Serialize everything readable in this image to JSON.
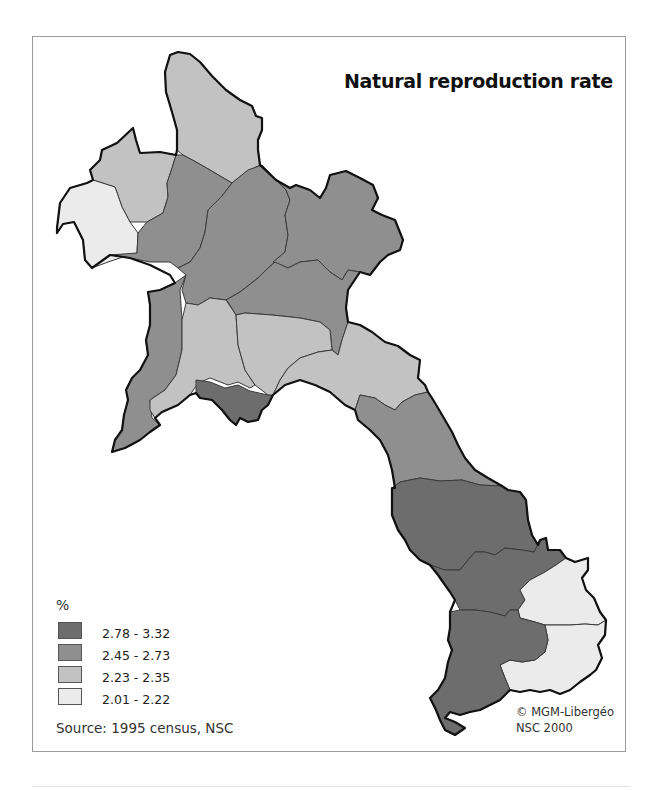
{
  "map": {
    "title": "Natural reproduction rate",
    "country": "Laos",
    "legend": {
      "unit": "%",
      "classes": [
        {
          "label": "2.78 - 3.32",
          "color": "#6d6d6d"
        },
        {
          "label": "2.45 - 2.73",
          "color": "#8f8f8f"
        },
        {
          "label": "2.23 - 2.35",
          "color": "#c2c2c2"
        },
        {
          "label": "2.01 - 2.22",
          "color": "#ebebeb"
        }
      ]
    },
    "source": "Source: 1995 census, NSC",
    "credit": {
      "line1": "© MGM-Libergéo",
      "line2": "NSC 2000"
    }
  }
}
